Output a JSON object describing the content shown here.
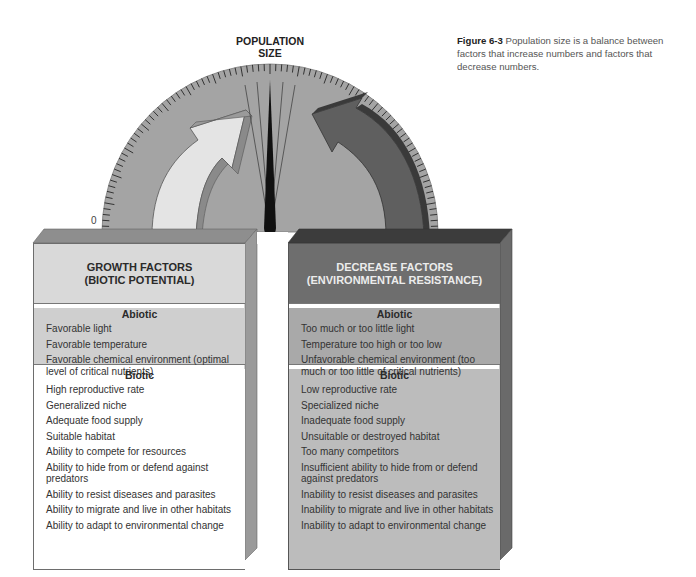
{
  "figure": {
    "caption_label": "Figure 6-3",
    "caption_text": " Population size is a balance between factors that increase numbers and factors that decrease numbers."
  },
  "gauge": {
    "title_line1": "POPULATION",
    "title_line2": "SIZE",
    "zero_label": "0",
    "colors": {
      "dial": "#a4a4a4",
      "needle": "#111111",
      "growth_arrow": "#e4e4e4",
      "decrease_arrow": "#5f5f5f"
    }
  },
  "growth_factors": {
    "title_line1": "GROWTH FACTORS",
    "title_line2": "(BIOTIC POTENTIAL)",
    "abiotic": {
      "title": "Abiotic",
      "items": [
        "Favorable light",
        "Favorable temperature",
        "Favorable chemical environment (optimal level of critical nutrients)"
      ]
    },
    "biotic": {
      "title": "Biotic",
      "items": [
        "High reproductive rate",
        "Generalized niche",
        "Adequate food supply",
        "Suitable habitat",
        "Ability to compete for resources",
        "Ability to hide from or defend against predators",
        "Ability to resist diseases and parasites",
        "Ability to migrate and live in other habitats",
        "Ability to adapt to environmental change"
      ]
    }
  },
  "decrease_factors": {
    "title_line1": "DECREASE FACTORS",
    "title_line2": "(ENVIRONMENTAL RESISTANCE)",
    "abiotic": {
      "title": "Abiotic",
      "items": [
        "Too much or too little light",
        "Temperature too high or too low",
        "Unfavorable chemical environment (too much or too little of critical nutrients)"
      ]
    },
    "biotic": {
      "title": "Biotic",
      "items": [
        "Low reproductive rate",
        "Specialized niche",
        "Inadequate food supply",
        "Unsuitable or destroyed habitat",
        "Too many competitors",
        "Insufficient ability to hide from or defend against predators",
        "Inability to resist diseases and parasites",
        "Inability to migrate and live in other habitats",
        "Inability to adapt to environmental change"
      ]
    }
  }
}
